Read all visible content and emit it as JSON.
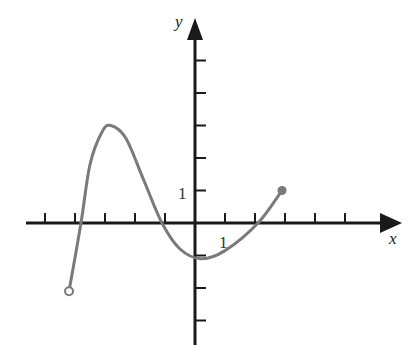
{
  "chart_data": {
    "type": "line",
    "title": "",
    "xlabel": "x",
    "ylabel": "y",
    "x_tick_label": "1",
    "y_tick_label": "1",
    "x_ticks": [
      -5,
      -4,
      -3,
      -2,
      -1,
      1,
      2,
      3,
      4,
      5
    ],
    "y_ticks": [
      -3,
      -2,
      -1,
      1,
      2,
      3,
      4,
      5
    ],
    "xlim": [
      -5.6,
      6.8
    ],
    "ylim": [
      -3.7,
      5.6
    ],
    "grid": false,
    "legend": null,
    "series": [
      {
        "name": "f(x)",
        "points": [
          {
            "x": -4.2,
            "y": -2.1
          },
          {
            "x": -3.8,
            "y": 0
          },
          {
            "x": -3.5,
            "y": 1.8
          },
          {
            "x": -3.1,
            "y": 2.8
          },
          {
            "x": -2.8,
            "y": 3.0
          },
          {
            "x": -2.3,
            "y": 2.6
          },
          {
            "x": -1.7,
            "y": 1.3
          },
          {
            "x": -1.1,
            "y": 0
          },
          {
            "x": -0.5,
            "y": -0.8
          },
          {
            "x": 0.2,
            "y": -1.1
          },
          {
            "x": 1.0,
            "y": -0.85
          },
          {
            "x": 2.1,
            "y": 0
          },
          {
            "x": 2.9,
            "y": 1.0
          }
        ],
        "start_point": {
          "x": -4.2,
          "y": -2.1,
          "style": "open-circle"
        },
        "end_point": {
          "x": 2.9,
          "y": 1.0,
          "style": "filled-circle"
        },
        "color": "#7a7a7a"
      }
    ],
    "annotations": [
      {
        "text": "1",
        "at": "x-axis tick 1"
      },
      {
        "text": "1",
        "at": "y-axis tick 1"
      }
    ]
  },
  "colors": {
    "axis": "#1a1a1a",
    "curve": "#7a7a7a",
    "background": "#ffffff"
  }
}
